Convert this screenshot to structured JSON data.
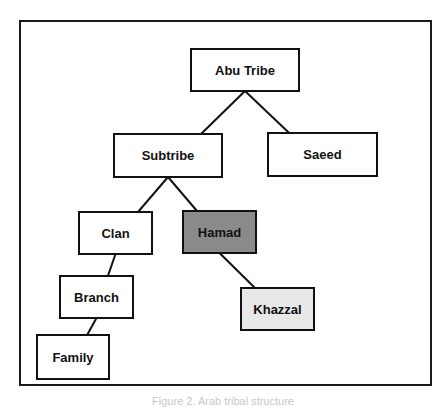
{
  "diagram": {
    "type": "tree",
    "nodes": [
      {
        "id": "abu_tribe",
        "label": "Abu Tribe",
        "fill": "#ffffff"
      },
      {
        "id": "subtribe",
        "label": "Subtribe",
        "fill": "#ffffff"
      },
      {
        "id": "saeed",
        "label": "Saeed",
        "fill": "#ffffff"
      },
      {
        "id": "clan",
        "label": "Clan",
        "fill": "#ffffff"
      },
      {
        "id": "hamad",
        "label": "Hamad",
        "fill": "#8a8a8a"
      },
      {
        "id": "branch",
        "label": "Branch",
        "fill": "#ffffff"
      },
      {
        "id": "khazzal",
        "label": "Khazzal",
        "fill": "#e8e8e8"
      },
      {
        "id": "family",
        "label": "Family",
        "fill": "#ffffff"
      }
    ],
    "edges": [
      [
        "abu_tribe",
        "subtribe"
      ],
      [
        "abu_tribe",
        "saeed"
      ],
      [
        "subtribe",
        "clan"
      ],
      [
        "subtribe",
        "hamad"
      ],
      [
        "clan",
        "branch"
      ],
      [
        "hamad",
        "khazzal"
      ],
      [
        "branch",
        "family"
      ]
    ]
  },
  "caption": "Figure 2. Arab tribal structure"
}
